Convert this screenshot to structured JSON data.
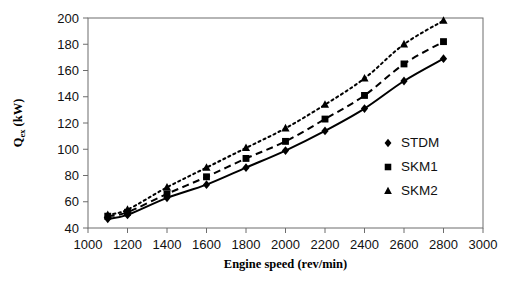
{
  "chart_data": {
    "type": "line",
    "title": "",
    "subtitle": "",
    "xlabel": "Engine speed (rev/min)",
    "ylabel": "Qex (kW)",
    "ylabel_base": "Q",
    "ylabel_subscript": "ex",
    "ylabel_unit": " (kW)",
    "x": [
      1100,
      1200,
      1400,
      1600,
      1800,
      2000,
      2200,
      2400,
      2600,
      2800
    ],
    "xlim": [
      1000,
      3000
    ],
    "ylim": [
      40,
      200
    ],
    "xticks": [
      1000,
      1200,
      1400,
      1600,
      1800,
      2000,
      2200,
      2400,
      2600,
      2800,
      3000
    ],
    "yticks": [
      40,
      60,
      80,
      100,
      120,
      140,
      160,
      180,
      200
    ],
    "xtick_labels": [
      "1000",
      "1200",
      "1400",
      "1600",
      "1800",
      "2000",
      "2200",
      "2400",
      "2600",
      "2800",
      "3000"
    ],
    "ytick_labels": [
      "40",
      "60",
      "80",
      "100",
      "120",
      "140",
      "160",
      "180",
      "200"
    ],
    "grid": false,
    "legend_position": "right-middle",
    "series": [
      {
        "name": "STDM",
        "marker": "diamond",
        "linestyle": "solid",
        "color": "#000000",
        "values": [
          47,
          50,
          63,
          73,
          86,
          99,
          114,
          131,
          152,
          169
        ]
      },
      {
        "name": "SKM1",
        "marker": "square",
        "linestyle": "dashed",
        "color": "#000000",
        "values": [
          49,
          52,
          66,
          79,
          93,
          106,
          123,
          141,
          165,
          182
        ]
      },
      {
        "name": "SKM2",
        "marker": "triangle",
        "linestyle": "dotted",
        "color": "#000000",
        "values": [
          50,
          54,
          71,
          86,
          101,
          116,
          134,
          154,
          180,
          198
        ]
      }
    ]
  },
  "legend": {
    "items": [
      {
        "label": "STDM",
        "marker": "diamond"
      },
      {
        "label": "SKM1",
        "marker": "square"
      },
      {
        "label": "SKM2",
        "marker": "triangle"
      }
    ]
  },
  "colors": {
    "axis": "#6d6d6d",
    "text": "#111111",
    "series": "#000000",
    "background": "#ffffff"
  }
}
